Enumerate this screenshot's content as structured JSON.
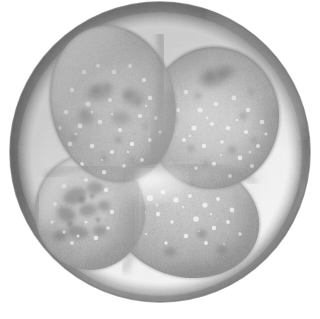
{
  "image": {
    "kind": "light-microscopy-photomicrograph",
    "subject": "four-cell stage embryo",
    "title": "4-cell embryo",
    "modality": "brightfield grayscale",
    "background_color": "#ffffff",
    "canvas": {
      "width": 320,
      "height": 319
    }
  },
  "specimen": {
    "zona_pellucida": {
      "label": "zona pellucida",
      "center": {
        "cx": 160,
        "cy": 152
      },
      "radius": 150,
      "outer_rim_color": "#7b7b7b",
      "mid_color": "#a9a9a9",
      "inner_color": "#cfcfcf",
      "highlight_color": "#f2f2f2",
      "shadow_color": "#6e6e6e"
    },
    "perivitelline_space": {
      "label": "perivitelline space",
      "color": "#f4f4f4",
      "inner_boundary_color": "#e2e2e2"
    },
    "cytoplasm": {
      "base_color": "#c2c2c2",
      "granule_bright_color": "#efefef",
      "granule_dark_color": "#8e8e8e",
      "membrane_color": "#8a8a8a"
    }
  },
  "blastomeres": [
    {
      "id": "blastomere-top-left",
      "label": "Blastomere 1 (upper left)",
      "cx": 113,
      "cy": 104,
      "rx": 62,
      "ry": 79,
      "rotation": -12,
      "fill": "#c4c4c4",
      "rim": "#9a9a9a"
    },
    {
      "id": "blastomere-top-right",
      "label": "Blastomere 2 (upper right)",
      "cx": 213,
      "cy": 118,
      "rx": 66,
      "ry": 71,
      "rotation": 8,
      "fill": "#c0c0c0",
      "rim": "#959595"
    },
    {
      "id": "blastomere-bottom-left",
      "label": "Blastomere 3 (lower left)",
      "cx": 90,
      "cy": 212,
      "rx": 55,
      "ry": 58,
      "rotation": -5,
      "fill": "#c6c6c6",
      "rim": "#9d9d9d"
    },
    {
      "id": "blastomere-bottom-right",
      "label": "Blastomere 4 (lower right)",
      "cx": 186,
      "cy": 218,
      "rx": 74,
      "ry": 59,
      "rotation": 14,
      "fill": "#bebebe",
      "rim": "#939393"
    }
  ],
  "annotations": {
    "cell_count": "4",
    "cell_count_label": "cells",
    "stage_label": "4-cell stage",
    "scale_visible": "false"
  },
  "viewer": {
    "zoom_level": "100%",
    "caption": "Four-cell stage embryo surrounded by the zona pellucida"
  }
}
